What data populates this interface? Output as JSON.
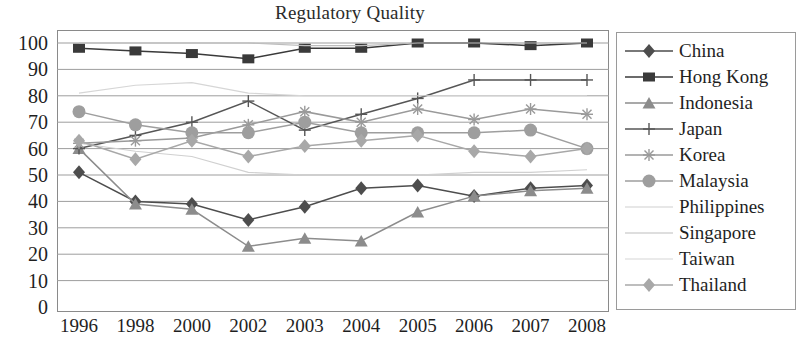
{
  "chart_data": {
    "type": "line",
    "title": "Regulatory Quality",
    "xlabel": "",
    "ylabel": "",
    "ylim": [
      0,
      100
    ],
    "ytick_step": 10,
    "yticks": [
      "100",
      "90",
      "80",
      "70",
      "60",
      "50",
      "40",
      "30",
      "20",
      "10",
      "0"
    ],
    "grid": true,
    "legend_position": "right",
    "categories": [
      "1996",
      "1998",
      "2000",
      "2002",
      "2003",
      "2004",
      "2005",
      "2006",
      "2007",
      "2008"
    ],
    "series": [
      {
        "name": "China",
        "marker": "diamond",
        "color": "#4d4d4d",
        "values": [
          51,
          40,
          39,
          33,
          38,
          45,
          46,
          42,
          45,
          46
        ]
      },
      {
        "name": "Hong Kong",
        "marker": "square",
        "color": "#3a3a3a",
        "values": [
          98,
          97,
          96,
          94,
          98,
          98,
          100,
          100,
          99,
          100
        ]
      },
      {
        "name": "Indonesia",
        "marker": "triangle",
        "color": "#8c8c8c",
        "values": [
          60,
          39,
          37,
          23,
          26,
          25,
          36,
          42,
          44,
          45
        ]
      },
      {
        "name": "Japan",
        "marker": "plus",
        "color": "#565656",
        "values": [
          60,
          65,
          70,
          78,
          67,
          73,
          79,
          86,
          86,
          86
        ]
      },
      {
        "name": "Korea",
        "marker": "asterisk",
        "color": "#9a9a9a",
        "values": [
          62,
          63,
          64,
          69,
          74,
          70,
          75,
          71,
          75,
          73
        ]
      },
      {
        "name": "Malaysia",
        "marker": "circle",
        "color": "#9e9e9e",
        "values": [
          74,
          69,
          66,
          66,
          70,
          66,
          66,
          66,
          67,
          60
        ]
      },
      {
        "name": "Philippines",
        "marker": "none",
        "color": "#d0d0d0",
        "values": [
          62,
          59,
          57,
          51,
          50,
          50,
          50,
          51,
          51,
          52
        ]
      },
      {
        "name": "Singapore",
        "marker": "none",
        "color": "#bdbdbd",
        "values": [
          100,
          100,
          100,
          100,
          99,
          99,
          100,
          100,
          100,
          100
        ]
      },
      {
        "name": "Taiwan",
        "marker": "none",
        "color": "#d6d6d6",
        "values": [
          81,
          84,
          85,
          81,
          80,
          80,
          80,
          80,
          80,
          80
        ]
      },
      {
        "name": "Thailand",
        "marker": "diamond-light",
        "color": "#a8a8a8",
        "values": [
          63,
          56,
          63,
          57,
          61,
          63,
          65,
          59,
          57,
          60
        ]
      }
    ]
  }
}
